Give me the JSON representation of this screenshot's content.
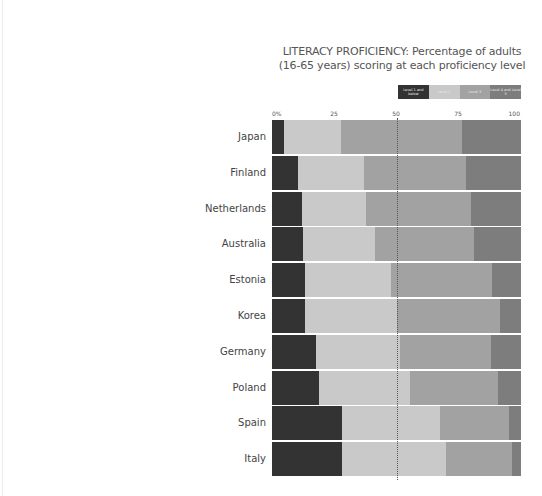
{
  "chart_data": {
    "type": "bar",
    "orientation": "horizontal",
    "stacked": true,
    "title": "LITERACY PROFICIENCY: Percentage of adults (16-65 years) scoring at each proficiency level",
    "title_lines": [
      "LITERACY PROFICIENCY: Percentage of adults",
      "(16-65 years) scoring at each proficiency level"
    ],
    "xlabel": "",
    "ylabel": "",
    "xlim": [
      0,
      100
    ],
    "x_ticks": [
      "0%",
      "25",
      "50",
      "75",
      "100"
    ],
    "reference_line": 50,
    "grid": false,
    "legend_position": "top-right",
    "categories": [
      "Japan",
      "Finland",
      "Netherlands",
      "Australia",
      "Estonia",
      "Korea",
      "Germany",
      "Poland",
      "Spain",
      "Italy"
    ],
    "series": [
      {
        "name": "Level 1 and below",
        "color": "#333333",
        "values": [
          4.8,
          10.6,
          12.0,
          12.4,
          13.1,
          13.1,
          17.6,
          19.0,
          28.1,
          28.1
        ]
      },
      {
        "name": "Level 2",
        "color": "#c9c9c9",
        "values": [
          23.0,
          26.5,
          25.9,
          29.1,
          34.5,
          37.2,
          33.7,
          36.4,
          39.2,
          41.7
        ]
      },
      {
        "name": "Level 3",
        "color": "#a2a2a2",
        "values": [
          48.7,
          41.0,
          42.2,
          39.7,
          40.7,
          41.2,
          36.6,
          35.2,
          28.0,
          26.6
        ]
      },
      {
        "name": "Level 4 and Level 5",
        "color": "#7d7d7d",
        "values": [
          23.5,
          21.9,
          19.9,
          18.8,
          11.7,
          8.5,
          12.1,
          9.4,
          4.7,
          3.6
        ]
      }
    ]
  }
}
